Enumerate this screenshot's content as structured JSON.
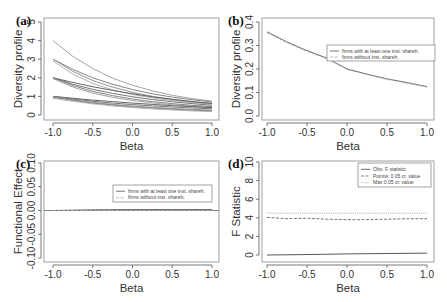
{
  "chart_data": [
    {
      "panel": "(a)",
      "type": "line",
      "xlabel": "Beta",
      "ylabel": "Diversity profile",
      "xlim": [
        -1.0,
        1.0
      ],
      "ylim": [
        0,
        5
      ],
      "xticks": [
        "-1.0",
        "-0.5",
        "0.0",
        "0.5",
        "1.0"
      ],
      "yticks": [
        "0",
        "1",
        "2",
        "3",
        "4",
        "5"
      ],
      "legend": null,
      "x": [
        -1.0,
        -0.75,
        -0.5,
        -0.25,
        0.0,
        0.25,
        0.5,
        0.75,
        1.0
      ],
      "series": [
        {
          "name": "curve-1",
          "color": "#999999",
          "values": [
            4.0,
            3.15,
            2.5,
            1.98,
            1.6,
            1.3,
            1.06,
            0.88,
            0.75
          ]
        },
        {
          "name": "curve-2",
          "color": "#777777",
          "values": [
            3.0,
            2.45,
            2.0,
            1.65,
            1.37,
            1.14,
            0.96,
            0.82,
            0.7
          ]
        },
        {
          "name": "curve-3",
          "color": "#888888",
          "values": [
            3.0,
            2.35,
            1.85,
            1.5,
            1.22,
            1.0,
            0.84,
            0.72,
            0.62
          ]
        },
        {
          "name": "curve-4",
          "color": "#aaaaaa",
          "values": [
            2.9,
            2.2,
            1.7,
            1.35,
            1.1,
            0.92,
            0.78,
            0.67,
            0.58
          ]
        },
        {
          "name": "curve-5",
          "color": "#555555",
          "values": [
            2.0,
            1.75,
            1.52,
            1.32,
            1.14,
            0.98,
            0.84,
            0.72,
            0.62
          ]
        },
        {
          "name": "curve-6",
          "color": "#666666",
          "values": [
            2.0,
            1.65,
            1.38,
            1.16,
            0.98,
            0.83,
            0.71,
            0.61,
            0.52
          ]
        },
        {
          "name": "curve-7",
          "color": "#777777",
          "values": [
            2.0,
            1.58,
            1.27,
            1.04,
            0.86,
            0.72,
            0.61,
            0.52,
            0.45
          ]
        },
        {
          "name": "curve-8",
          "color": "#999999",
          "values": [
            1.95,
            1.5,
            1.18,
            0.95,
            0.78,
            0.65,
            0.55,
            0.47,
            0.4
          ]
        },
        {
          "name": "curve-9",
          "color": "#555555",
          "values": [
            1.0,
            0.9,
            0.8,
            0.72,
            0.64,
            0.57,
            0.5,
            0.45,
            0.4
          ]
        },
        {
          "name": "curve-10",
          "color": "#666666",
          "values": [
            1.0,
            0.86,
            0.74,
            0.64,
            0.56,
            0.49,
            0.43,
            0.38,
            0.33
          ]
        },
        {
          "name": "curve-11",
          "color": "#888888",
          "values": [
            1.0,
            0.82,
            0.68,
            0.57,
            0.48,
            0.41,
            0.35,
            0.3,
            0.26
          ]
        },
        {
          "name": "curve-12",
          "color": "#777777",
          "values": [
            0.95,
            0.78,
            0.64,
            0.53,
            0.44,
            0.37,
            0.31,
            0.26,
            0.22
          ]
        },
        {
          "name": "curve-13",
          "color": "#aaaaaa",
          "values": [
            0.9,
            0.74,
            0.6,
            0.49,
            0.4,
            0.33,
            0.27,
            0.22,
            0.18
          ]
        }
      ]
    },
    {
      "panel": "(b)",
      "type": "line",
      "xlabel": "Beta",
      "ylabel": "Diversity profile",
      "xlim": [
        -1.0,
        1.0
      ],
      "ylim": [
        0.0,
        0.4
      ],
      "xticks": [
        "-1.0",
        "-0.5",
        "0.0",
        "0.5",
        "1.0"
      ],
      "yticks": [
        "0.0",
        "0.1",
        "0.2",
        "0.3",
        "0.4"
      ],
      "legend": {
        "position": "center-right",
        "entries": [
          {
            "label": "firms with at least one inst. shareh.",
            "style": "solid"
          },
          {
            "label": "firms without inst. shareh.",
            "style": "dashed"
          }
        ]
      },
      "x": [
        -1.0,
        -0.75,
        -0.5,
        -0.25,
        0.0,
        0.25,
        0.5,
        0.75,
        1.0
      ],
      "series": [
        {
          "name": "firms with at least one inst. shareh.",
          "color": "#555555",
          "style": "solid",
          "values": [
            0.358,
            0.315,
            0.278,
            0.246,
            0.2,
            0.178,
            0.158,
            0.142,
            0.125
          ]
        },
        {
          "name": "firms without inst. shareh.",
          "color": "#aaaaaa",
          "style": "dashed",
          "values": [
            0.355,
            0.312,
            0.275,
            0.244,
            0.198,
            0.176,
            0.156,
            0.14,
            0.123
          ]
        }
      ]
    },
    {
      "panel": "(c)",
      "type": "line",
      "xlabel": "Beta",
      "ylabel": "Functional Effect",
      "xlim": [
        -1.0,
        1.0
      ],
      "ylim": [
        -0.1,
        0.1
      ],
      "xticks": [
        "-1.0",
        "-0.5",
        "0.0",
        "0.5",
        "1.0"
      ],
      "yticks": [
        "-0.10",
        "-0.05",
        "0.00",
        "0.05",
        "0.10"
      ],
      "legend": {
        "position": "top-right",
        "entries": [
          {
            "label": "firms with at least one inst. shareh.",
            "style": "solid"
          },
          {
            "label": "firms without inst. shareh.",
            "style": "dashed"
          }
        ]
      },
      "x": [
        -1.0,
        -0.5,
        0.0,
        0.5,
        1.0
      ],
      "series": [
        {
          "name": "firms with at least one inst. shareh.",
          "color": "#555555",
          "style": "solid",
          "values": [
            0.0,
            0.0015,
            0.002,
            0.002,
            0.002
          ]
        },
        {
          "name": "firms without inst. shareh.",
          "color": "#aaaaaa",
          "style": "dashed",
          "values": [
            0.0,
            0.0,
            0.0,
            0.0,
            0.0
          ]
        }
      ]
    },
    {
      "panel": "(d)",
      "type": "line",
      "xlabel": "Beta",
      "ylabel": "F Statistic",
      "xlim": [
        -1.0,
        1.0
      ],
      "ylim": [
        0,
        10
      ],
      "xticks": [
        "-1.0",
        "-0.5",
        "0.0",
        "0.5",
        "1.0"
      ],
      "yticks": [
        "0",
        "2",
        "4",
        "6",
        "8",
        "10"
      ],
      "legend": {
        "position": "top-right",
        "entries": [
          {
            "label": "Obs. F statistic",
            "style": "solid"
          },
          {
            "label": "Pointw. 0.05 cr. value",
            "style": "dashed"
          },
          {
            "label": "Max 0.05 cr. value",
            "style": "dotted"
          }
        ]
      },
      "x": [
        -1.0,
        -0.75,
        -0.5,
        -0.25,
        0.0,
        0.25,
        0.5,
        0.75,
        1.0
      ],
      "series": [
        {
          "name": "Obs. F statistic",
          "color": "#444444",
          "style": "solid",
          "values": [
            0.0,
            0.02,
            0.05,
            0.08,
            0.12,
            0.14,
            0.16,
            0.18,
            0.2
          ]
        },
        {
          "name": "Pointw. 0.05 cr. value",
          "color": "#666666",
          "style": "dashed",
          "values": [
            4.05,
            3.9,
            3.95,
            3.85,
            3.8,
            3.8,
            3.85,
            3.9,
            3.9
          ]
        },
        {
          "name": "Max 0.05 cr. value",
          "color": "#999999",
          "style": "dotted",
          "values": [
            4.5,
            4.5,
            4.5,
            4.5,
            4.5,
            4.5,
            4.5,
            4.5,
            4.5
          ]
        }
      ]
    }
  ]
}
